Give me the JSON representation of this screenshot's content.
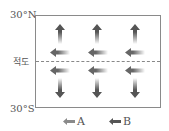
{
  "diagram": {
    "title": "",
    "latitude_labels": {
      "north": "30°N",
      "equator": "적도",
      "south": "30°S"
    },
    "colors": {
      "arrow_A": "#7a7a7a",
      "arrow_B": "#555555",
      "frame": "#8a8a8a",
      "equator_line": "#888888"
    },
    "columns": 3,
    "north_hemisphere": {
      "vertical_arrow": "up (A)",
      "horizontal_arrow": "west (B)"
    },
    "south_hemisphere": {
      "horizontal_arrow": "west (B)",
      "vertical_arrow": "down (A)"
    },
    "legend": [
      {
        "key": "A",
        "icon": "left-arrow-light"
      },
      {
        "key": "B",
        "icon": "left-arrow-dark"
      }
    ]
  }
}
